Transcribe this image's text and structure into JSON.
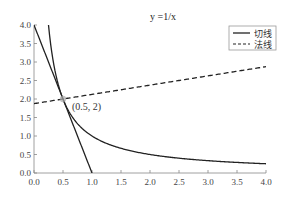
{
  "chart_data": {
    "type": "line",
    "title": "y =1/x",
    "xlabel": "",
    "ylabel": "",
    "xlim": [
      0.0,
      4.0
    ],
    "ylim": [
      0.0,
      4.0
    ],
    "x_ticks": [
      "0.0",
      "0.5",
      "1.0",
      "1.5",
      "2.0",
      "2.5",
      "3.0",
      "3.5",
      "4.0"
    ],
    "y_ticks": [
      "0.0",
      "0.5",
      "1.0",
      "1.5",
      "2.0",
      "2.5",
      "3.0",
      "3.5",
      "4.0"
    ],
    "grid": false,
    "legend_position": "upper right",
    "series": [
      {
        "name": "y=1/x",
        "style": "solid",
        "function": "1/x",
        "x_range": [
          0.25,
          4.0
        ],
        "in_legend": false
      },
      {
        "name": "切线",
        "style": "solid",
        "function": "-4x+4",
        "x_range": [
          0.0,
          1.0
        ],
        "in_legend": true
      },
      {
        "name": "法线",
        "style": "dashed",
        "function": "0.25x+1.875",
        "x_range": [
          0.0,
          4.0
        ],
        "in_legend": true
      }
    ],
    "annotations": [
      {
        "text": "(0.5, 2)",
        "x": 0.5,
        "y": 2.0,
        "marker": "circle"
      }
    ]
  },
  "legend": {
    "items": [
      {
        "label": "切线",
        "style": "solid"
      },
      {
        "label": "法线",
        "style": "dashed"
      }
    ]
  },
  "colors": {
    "line": "#222222",
    "axis": "#888888",
    "marker": "#aaaaaa"
  }
}
